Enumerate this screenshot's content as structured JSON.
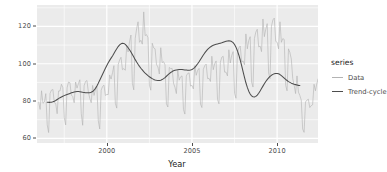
{
  "chart_data": {
    "type": "line",
    "title": "",
    "xlabel": "Year",
    "ylabel": "New orders index",
    "xlim": [
      1995.9,
      2012.4
    ],
    "ylim": [
      57.5,
      131.5
    ],
    "xticks": [
      2000,
      2005,
      2010
    ],
    "xtick_labels": [
      "2000",
      "2005",
      "2010"
    ],
    "yticks": [
      60,
      80,
      100,
      120
    ],
    "ytick_labels": [
      "60",
      "100",
      "80",
      "120"
    ],
    "grid": true,
    "grid_major": true,
    "grid_minor": true,
    "legend_position": "right",
    "legend_title": "series",
    "panel_background": "#EBEBEB",
    "gridline_color": "#FFFFFF",
    "series": [
      {
        "name": "Data",
        "color": "#B3B3B3",
        "x_start": 1996.0,
        "x_step": 0.0833333,
        "values": [
          79.4,
          75.5,
          85.5,
          78.8,
          79.5,
          84.0,
          67.2,
          63.1,
          84.1,
          85.9,
          86.2,
          79.1,
          78.7,
          73.2,
          85.4,
          85.4,
          89.0,
          87.2,
          71.1,
          67.2,
          87.1,
          90.2,
          89.8,
          83.2,
          82.4,
          79.1,
          90.2,
          86.9,
          89.4,
          91.4,
          73.2,
          67.0,
          88.2,
          90.5,
          91.0,
          84.8,
          81.4,
          79.1,
          88.4,
          83.0,
          86.4,
          88.0,
          69.4,
          65.0,
          85.8,
          87.8,
          88.5,
          83.0,
          83.5,
          83.5,
          94.0,
          91.8,
          95.2,
          99.0,
          78.8,
          76.2,
          99.5,
          102.0,
          103.5,
          96.8,
          97.4,
          96.5,
          109.5,
          106.3,
          111.8,
          115.4,
          89.5,
          86.0,
          113.6,
          118.8,
          122.5,
          111.5,
          112.6,
          110.5,
          127.8,
          115.1,
          115.6,
          114.0,
          88.5,
          85.8,
          111.0,
          108.5,
          108.0,
          99.5,
          98.3,
          94.5,
          108.6,
          100.6,
          101.1,
          99.4,
          78.5,
          76.8,
          98.0,
          97.4,
          97.5,
          89.5,
          87.4,
          84.0,
          96.4,
          91.2,
          93.0,
          93.5,
          75.4,
          73.0,
          93.5,
          94.8,
          95.1,
          88.0,
          88.4,
          86.5,
          99.0,
          93.8,
          96.5,
          97.5,
          78.4,
          76.5,
          97.0,
          99.0,
          99.8,
          92.0,
          92.2,
          90.5,
          104.0,
          96.8,
          100.0,
          101.5,
          80.8,
          78.5,
          100.8,
          103.5,
          104.0,
          95.5,
          95.5,
          93.5,
          107.5,
          100.4,
          104.5,
          106.5,
          84.2,
          81.5,
          105.8,
          108.5,
          109.5,
          101.0,
          101.5,
          99.5,
          116.0,
          108.0,
          112.5,
          114.5,
          90.2,
          87.5,
          113.5,
          117.0,
          118.5,
          109.0,
          109.5,
          106.5,
          124.0,
          114.5,
          118.5,
          121.5,
          95.0,
          92.0,
          120.0,
          123.5,
          124.5,
          112.0,
          111.5,
          108.0,
          122.5,
          111.5,
          113.5,
          113.0,
          88.5,
          85.5,
          108.0,
          106.0,
          102.5,
          92.0,
          88.5,
          84.0,
          93.5,
          84.8,
          83.0,
          80.5,
          65.0,
          63.2,
          79.5,
          80.5,
          81.0,
          76.5,
          77.5,
          78.0,
          89.0,
          85.5,
          89.5,
          92.0,
          73.5,
          71.0,
          92.5,
          95.5,
          97.0,
          90.5,
          91.5,
          89.5,
          103.0,
          95.5,
          99.0,
          99.5,
          79.0,
          76.5,
          97.0,
          98.5,
          98.0,
          90.0,
          90.5,
          88.0,
          99.5,
          92.5,
          95.0,
          94.5,
          76.0,
          74.5,
          93.0,
          94.0,
          93.5,
          88.0,
          88.5,
          87.5,
          96.5,
          92.0,
          93.5,
          92.5,
          88.0
        ]
      },
      {
        "name": "Trend-cycle",
        "color": "#4D4D4D",
        "x_start": 1996.5,
        "x_step": 0.0833333,
        "values": [
          79.4,
          79.3,
          79.3,
          79.4,
          79.6,
          79.9,
          80.3,
          80.8,
          81.3,
          81.8,
          82.2,
          82.6,
          82.9,
          83.2,
          83.5,
          83.8,
          84.1,
          84.4,
          84.6,
          84.8,
          85.0,
          85.1,
          85.1,
          85.0,
          84.9,
          84.7,
          84.6,
          84.5,
          84.4,
          84.4,
          84.5,
          84.7,
          85.1,
          85.8,
          86.8,
          88.1,
          89.6,
          91.2,
          92.8,
          94.4,
          96.0,
          97.6,
          99.1,
          100.5,
          101.8,
          103.0,
          104.2,
          105.5,
          106.8,
          108.0,
          109.2,
          110.1,
          110.7,
          111.0,
          110.9,
          110.4,
          109.6,
          108.6,
          107.5,
          106.3,
          105.0,
          103.6,
          102.2,
          100.9,
          99.7,
          98.6,
          97.6,
          96.7,
          95.8,
          95.0,
          94.3,
          93.6,
          93.0,
          92.5,
          92.0,
          91.6,
          91.3,
          91.1,
          91.0,
          91.0,
          91.2,
          91.5,
          92.0,
          92.6,
          93.3,
          94.0,
          94.7,
          95.3,
          95.8,
          96.2,
          96.5,
          96.7,
          96.8,
          96.9,
          96.9,
          96.9,
          96.8,
          96.7,
          96.6,
          96.5,
          96.5,
          96.6,
          96.9,
          97.4,
          98.1,
          99.0,
          100.0,
          101.1,
          102.3,
          103.5,
          104.7,
          105.8,
          106.8,
          107.7,
          108.4,
          109.0,
          109.5,
          109.9,
          110.2,
          110.4,
          110.6,
          110.8,
          111.0,
          111.2,
          111.5,
          111.8,
          112.0,
          112.2,
          112.3,
          112.2,
          111.9,
          111.3,
          110.3,
          108.9,
          107.0,
          104.7,
          102.0,
          99.0,
          95.8,
          92.7,
          89.8,
          87.3,
          85.3,
          83.8,
          82.8,
          82.3,
          82.2,
          82.5,
          83.2,
          84.2,
          85.4,
          86.7,
          88.0,
          89.3,
          90.5,
          91.5,
          92.4,
          93.2,
          93.8,
          94.3,
          94.6,
          94.8,
          94.8,
          94.6,
          94.2,
          93.6,
          93.0,
          92.3,
          91.6,
          91.0,
          90.4,
          90.0,
          89.6,
          89.3,
          89.0,
          88.8,
          88.6,
          88.4,
          88.3
        ]
      }
    ]
  },
  "axes": {
    "ylabel": "New orders index",
    "xlabel": "Year",
    "ytick_labels": [
      "120",
      "100",
      "80",
      "60"
    ],
    "xtick_labels": [
      "2000",
      "2005",
      "2010"
    ]
  },
  "legend": {
    "title": "series",
    "items": [
      {
        "label": "Data",
        "color": "#B3B3B3"
      },
      {
        "label": "Trend-cycle",
        "color": "#4D4D4D"
      }
    ]
  }
}
